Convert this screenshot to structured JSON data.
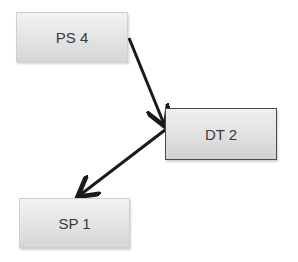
{
  "diagram": {
    "nodes": [
      {
        "id": "ps4",
        "label": "PS 4"
      },
      {
        "id": "dt2",
        "label": "DT 2"
      },
      {
        "id": "sp1",
        "label": "SP 1"
      }
    ],
    "edges": [
      {
        "from": "ps4",
        "to": "dt2",
        "directed": true
      },
      {
        "from": "dt2",
        "to": "sp1",
        "directed": true
      }
    ],
    "colors": {
      "edge": "#1a1a1a",
      "node_text": "#3a3a3a"
    }
  }
}
